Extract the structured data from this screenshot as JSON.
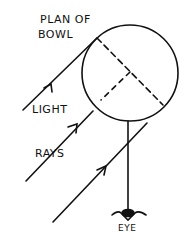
{
  "labels": {
    "title_line1": "PLAN OF",
    "title_line2": "BOWL",
    "light": "LIGHT",
    "rays": "RAYS",
    "eye": "EYE"
  },
  "colors": {
    "ink": "#111111",
    "background": "#ffffff"
  }
}
